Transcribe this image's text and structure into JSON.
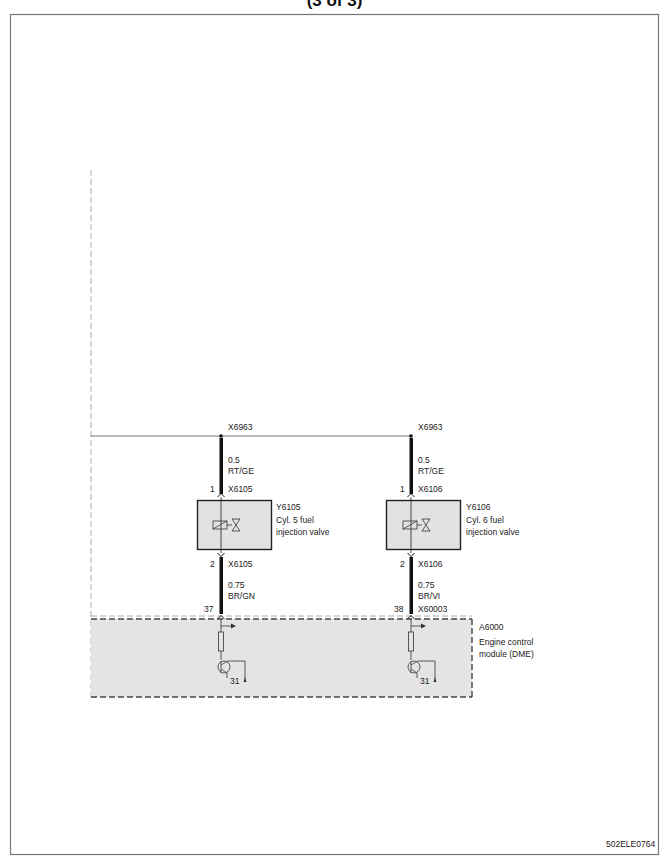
{
  "page": {
    "title": "(3 of 3)",
    "figure_id": "502ELE0764"
  },
  "circuit": {
    "splice_left": "X6963",
    "splice_right": "X6963",
    "left": {
      "wire_top_size": "0.5",
      "wire_top_color": "RT/GE",
      "pin_top": "1",
      "conn_top": "X6105",
      "component_id": "Y6105",
      "component_desc_1": "Cyl. 5 fuel",
      "component_desc_2": "injection valve",
      "pin_bottom": "2",
      "conn_bottom": "X6105",
      "wire_bottom_size": "0.75",
      "wire_bottom_color": "BR/GN",
      "module_pin": "37",
      "ground": "31"
    },
    "right": {
      "wire_top_size": "0.5",
      "wire_top_color": "RT/GE",
      "pin_top": "1",
      "conn_top": "X6106",
      "component_id": "Y6106",
      "component_desc_1": "Cyl. 6  fuel",
      "component_desc_2": "injection valve",
      "pin_bottom": "2",
      "conn_bottom": "X6106",
      "wire_bottom_size": "0.75",
      "wire_bottom_color": "BR/VI",
      "module_pin": "38",
      "module_conn": "X60003",
      "ground": "31"
    },
    "module": {
      "id": "A6000",
      "desc_1": "Engine control",
      "desc_2": "module (DME)"
    }
  },
  "colors": {
    "frame": "#777777",
    "wire": "#111111",
    "box_fill": "#e2e2e2",
    "module_fill": "#e4e4e4"
  }
}
